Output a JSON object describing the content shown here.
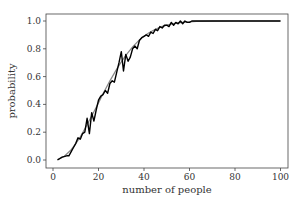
{
  "chart_data": {
    "type": "line",
    "title": "",
    "xlabel": "number of people",
    "ylabel": "probability",
    "xlim": [
      -3,
      104
    ],
    "ylim": [
      -0.05,
      1.05
    ],
    "xticks": [
      0,
      20,
      40,
      60,
      80,
      100
    ],
    "xtick_labels": [
      "0",
      "20",
      "40",
      "60",
      "80",
      "100"
    ],
    "yticks": [
      0.0,
      0.2,
      0.4,
      0.6,
      0.8,
      1.0
    ],
    "ytick_labels": [
      "0.0",
      "0.2",
      "0.4",
      "0.6",
      "0.8",
      "1.0"
    ],
    "grid": false,
    "legend": null,
    "series": [
      {
        "name": "theoretical",
        "color": "#888888",
        "style": "smooth",
        "x": [
          2,
          5,
          8,
          10,
          12,
          15,
          18,
          20,
          22,
          25,
          28,
          30,
          32,
          35,
          38,
          40,
          42,
          45,
          48,
          50,
          53,
          55,
          57,
          60,
          63,
          65,
          70,
          80,
          90,
          100
        ],
        "y": [
          0.003,
          0.027,
          0.074,
          0.117,
          0.167,
          0.253,
          0.347,
          0.411,
          0.476,
          0.569,
          0.654,
          0.706,
          0.753,
          0.814,
          0.864,
          0.891,
          0.914,
          0.941,
          0.961,
          0.97,
          0.981,
          0.986,
          0.99,
          0.994,
          0.997,
          0.998,
          0.999,
          1.0,
          1.0,
          1.0
        ]
      },
      {
        "name": "simulated",
        "color": "#000000",
        "style": "jagged",
        "x": [
          2,
          4,
          6,
          7,
          8,
          9,
          10,
          11,
          12,
          13,
          14,
          15,
          16,
          17,
          18,
          19,
          20,
          21,
          22,
          23,
          24,
          25,
          26,
          27,
          28,
          29,
          30,
          31,
          32,
          33,
          34,
          35,
          36,
          37,
          38,
          39,
          40,
          41,
          42,
          43,
          44,
          45,
          46,
          47,
          48,
          49,
          50,
          51,
          52,
          53,
          54,
          55,
          56,
          57,
          58,
          59,
          60,
          61,
          62,
          63,
          64,
          65,
          66,
          68,
          70,
          75,
          80,
          90,
          100
        ],
        "y": [
          0.0,
          0.02,
          0.03,
          0.03,
          0.06,
          0.09,
          0.12,
          0.16,
          0.15,
          0.19,
          0.2,
          0.3,
          0.19,
          0.34,
          0.28,
          0.36,
          0.43,
          0.46,
          0.47,
          0.5,
          0.48,
          0.55,
          0.57,
          0.56,
          0.63,
          0.7,
          0.78,
          0.64,
          0.76,
          0.71,
          0.74,
          0.8,
          0.82,
          0.8,
          0.86,
          0.88,
          0.89,
          0.9,
          0.89,
          0.92,
          0.91,
          0.94,
          0.93,
          0.96,
          0.95,
          0.97,
          0.97,
          0.96,
          0.99,
          0.97,
          0.99,
          0.98,
          1.0,
          0.98,
          1.0,
          0.99,
          0.99,
          1.0,
          1.0,
          1.0,
          1.0,
          1.0,
          1.0,
          1.0,
          1.0,
          1.0,
          1.0,
          1.0,
          1.0
        ]
      }
    ]
  },
  "layout": {
    "frame": {
      "left": 46,
      "top": 14,
      "right": 288,
      "bottom": 168
    },
    "x_origin_px": 53,
    "x_scale_px": 2.275,
    "y_origin_px": 160,
    "y_scale_px": 139
  }
}
